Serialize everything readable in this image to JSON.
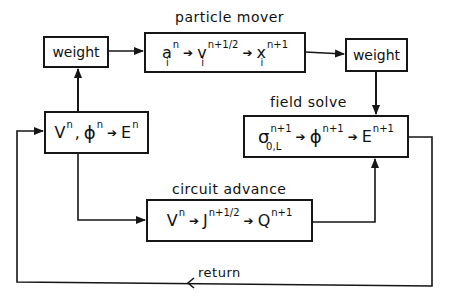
{
  "diagram": {
    "title": "",
    "stroke_color": "#161616",
    "background": "#ffffff",
    "nodes": [
      {
        "id": "weight_left",
        "label": "weight"
      },
      {
        "id": "particle_mover",
        "title": "particle mover",
        "terms": [
          {
            "base": "a",
            "sup": "n",
            "sub": "i"
          },
          {
            "base": "v",
            "sup": "n+1/2",
            "sub": "i"
          },
          {
            "base": "x",
            "sup": "n+1",
            "sub": "i"
          }
        ]
      },
      {
        "id": "weight_right",
        "label": "weight"
      },
      {
        "id": "field_solve",
        "title": "field solve",
        "terms": [
          {
            "base": "σ",
            "sup": "n+1",
            "sub": "0,L"
          },
          {
            "base": "ϕ",
            "sup": "n+1",
            "sub": ""
          },
          {
            "base": "E",
            "sup": "n+1",
            "sub": ""
          }
        ]
      },
      {
        "id": "field_start",
        "title": "",
        "terms_left": [
          {
            "base": "V",
            "sup": "n"
          },
          {
            "base": "ϕ",
            "sup": "n"
          }
        ],
        "separator": ",",
        "result": {
          "base": "E",
          "sup": "n"
        }
      },
      {
        "id": "circuit_advance",
        "title": "circuit advance",
        "terms": [
          {
            "base": "V",
            "sup": "n"
          },
          {
            "base": "J",
            "sup": "n+1/2"
          },
          {
            "base": "Q",
            "sup": "n+1"
          }
        ]
      }
    ],
    "arrow_glyph": "➔",
    "return_label": "return",
    "edges": [
      {
        "from": "field_start",
        "to": "weight_left"
      },
      {
        "from": "weight_left",
        "to": "particle_mover"
      },
      {
        "from": "particle_mover",
        "to": "weight_right"
      },
      {
        "from": "weight_right",
        "to": "field_solve"
      },
      {
        "from": "field_start",
        "to": "circuit_advance"
      },
      {
        "from": "circuit_advance",
        "to": "field_solve"
      },
      {
        "from": "field_solve",
        "to": "field_start",
        "label": "return"
      }
    ]
  }
}
